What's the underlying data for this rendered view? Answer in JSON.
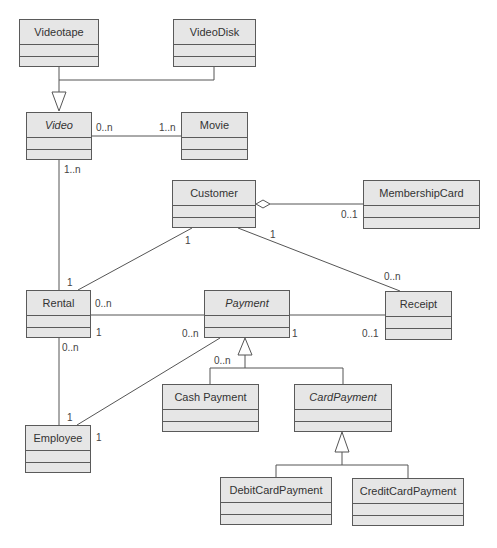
{
  "classes": {
    "videotape": {
      "name": "Videotape",
      "abstract": false
    },
    "videodisk": {
      "name": "VideoDisk",
      "abstract": false
    },
    "video": {
      "name": "Video",
      "abstract": true
    },
    "movie": {
      "name": "Movie",
      "abstract": false
    },
    "customer": {
      "name": "Customer",
      "abstract": false
    },
    "membershipcard": {
      "name": "MembershipCard",
      "abstract": false
    },
    "rental": {
      "name": "Rental",
      "abstract": false
    },
    "payment": {
      "name": "Payment",
      "abstract": true
    },
    "receipt": {
      "name": "Receipt",
      "abstract": false
    },
    "cashpayment": {
      "name": "Cash Payment",
      "abstract": false
    },
    "cardpayment": {
      "name": "CardPayment",
      "abstract": true
    },
    "employee": {
      "name": "Employee",
      "abstract": false
    },
    "debitcardpayment": {
      "name": "DebitCardPayment",
      "abstract": false
    },
    "creditcardpayment": {
      "name": "CreditCardPayment",
      "abstract": false
    }
  },
  "relationships": [
    {
      "type": "generalization",
      "children": [
        "Videotape",
        "VideoDisk"
      ],
      "parent": "Video"
    },
    {
      "type": "association",
      "from": "Video",
      "to": "Movie",
      "from_mult": "0..n",
      "to_mult": "1..n"
    },
    {
      "type": "association",
      "from": "Video",
      "to": "Rental",
      "from_mult": "1..n",
      "to_mult": "1"
    },
    {
      "type": "aggregation",
      "from": "Customer",
      "to": "MembershipCard",
      "to_mult": "0..1"
    },
    {
      "type": "association",
      "from": "Customer",
      "to": "Rental",
      "from_mult": "1"
    },
    {
      "type": "association",
      "from": "Customer",
      "to": "Receipt",
      "from_mult": "1",
      "to_mult": "0..n"
    },
    {
      "type": "association",
      "from": "Rental",
      "to": "Payment",
      "from_mult": "0..n",
      "to_mult": "1"
    },
    {
      "type": "association",
      "from": "Payment",
      "to": "Receipt",
      "from_mult": "1",
      "to_mult": "0..1"
    },
    {
      "type": "association",
      "from": "Rental",
      "to": "Employee",
      "from_mult": "0..n",
      "to_mult": "1"
    },
    {
      "type": "association",
      "from": "Payment",
      "to": "Employee",
      "from_mult": "0..n",
      "to_mult": "1"
    },
    {
      "type": "generalization",
      "children": [
        "Cash Payment",
        "CardPayment"
      ],
      "parent": "Payment",
      "mult": "0..n"
    },
    {
      "type": "generalization",
      "children": [
        "DebitCardPayment",
        "CreditCardPayment"
      ],
      "parent": "CardPayment"
    }
  ],
  "multiplicities": {
    "video_movie_left": "0..n",
    "video_movie_right": "1..n",
    "video_rental_top": "1..n",
    "rental_top": "1",
    "customer_rental": "1",
    "customer_receipt": "1",
    "receipt_top": "0..n",
    "membership": "0..1",
    "rental_payment_left": "0..n",
    "rental_right_1": "1",
    "payment_left": "0..n",
    "payment_right": "1",
    "receipt_left": "0..1",
    "rental_bottom": "0..n",
    "generalization_payment": "0..n",
    "employee_top": "1",
    "employee_right": "1"
  }
}
